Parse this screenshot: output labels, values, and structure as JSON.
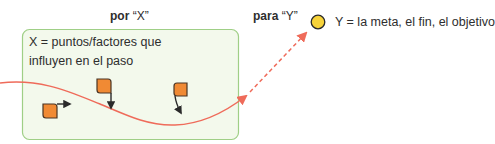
{
  "diagram": {
    "por_label": {
      "bold": "por",
      "quoted": "“X”"
    },
    "para_label": {
      "bold": "para",
      "quoted": "“Y”"
    },
    "box_text_line1": "X = puntos/factores que",
    "box_text_line2": "influyen en el paso",
    "goal_text": "Y = la meta, el fin, el objetivo",
    "icons": {
      "goal": "goal-circle-icon",
      "factor": "factor-square-icon",
      "direction": "arrow-icon"
    },
    "colors": {
      "box_fill": "#f3f9ec",
      "box_border": "#9fcf86",
      "path_line": "#ef6b5a",
      "factor_fill": "#f08a34",
      "factor_border": "#4a3524",
      "factor_arrow": "#2a2a2a",
      "goal_fill": "#f7d33a",
      "goal_border": "#2a2a2a"
    }
  }
}
